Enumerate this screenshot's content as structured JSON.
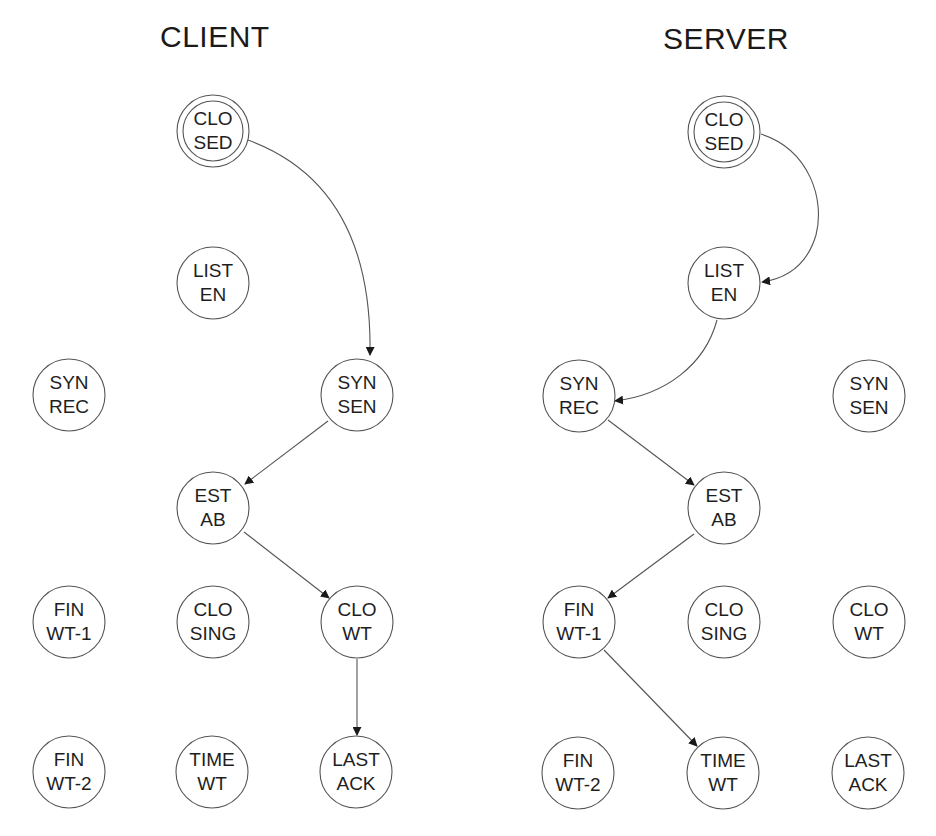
{
  "titles": {
    "client": "CLIENT",
    "server": "SERVER"
  },
  "colors": {
    "stroke": "#555555",
    "text": "#1e1e1e",
    "background": "#ffffff"
  },
  "client": {
    "nodes": [
      {
        "id": "closed",
        "line1": "CLO",
        "line2": "SED",
        "double": true,
        "x": 213,
        "y": 131
      },
      {
        "id": "listen",
        "line1": "LIST",
        "line2": "EN",
        "x": 213,
        "y": 283
      },
      {
        "id": "syn-rec",
        "line1": "SYN",
        "line2": "REC",
        "x": 69,
        "y": 395
      },
      {
        "id": "syn-sen",
        "line1": "SYN",
        "line2": "SEN",
        "x": 357,
        "y": 395
      },
      {
        "id": "estab",
        "line1": "EST",
        "line2": "AB",
        "x": 213,
        "y": 508
      },
      {
        "id": "fin-wt-1",
        "line1": "FIN",
        "line2": "WT-1",
        "x": 69,
        "y": 622
      },
      {
        "id": "closing",
        "line1": "CLO",
        "line2": "SING",
        "x": 213,
        "y": 622
      },
      {
        "id": "close-wt",
        "line1": "CLO",
        "line2": "WT",
        "x": 357,
        "y": 622
      },
      {
        "id": "fin-wt-2",
        "line1": "FIN",
        "line2": "WT-2",
        "x": 69,
        "y": 772
      },
      {
        "id": "time-wt",
        "line1": "TIME",
        "line2": "WT",
        "x": 213,
        "y": 772
      },
      {
        "id": "last-ack",
        "line1": "LAST",
        "line2": "ACK",
        "x": 357,
        "y": 772
      }
    ],
    "edges": [
      {
        "from": "closed",
        "to": "syn-sen",
        "curved": true
      },
      {
        "from": "syn-sen",
        "to": "estab"
      },
      {
        "from": "estab",
        "to": "close-wt"
      },
      {
        "from": "close-wt",
        "to": "last-ack"
      }
    ]
  },
  "server": {
    "nodes": [
      {
        "id": "closed",
        "line1": "CLO",
        "line2": "SED",
        "double": true,
        "x": 724,
        "y": 131
      },
      {
        "id": "listen",
        "line1": "LIST",
        "line2": "EN",
        "x": 724,
        "y": 283
      },
      {
        "id": "syn-rec",
        "line1": "SYN",
        "line2": "REC",
        "x": 579,
        "y": 396
      },
      {
        "id": "syn-sen",
        "line1": "SYN",
        "line2": "SEN",
        "x": 869,
        "y": 396
      },
      {
        "id": "estab",
        "line1": "EST",
        "line2": "AB",
        "x": 724,
        "y": 508
      },
      {
        "id": "fin-wt-1",
        "line1": "FIN",
        "line2": "WT-1",
        "x": 579,
        "y": 622
      },
      {
        "id": "closing",
        "line1": "CLO",
        "line2": "SING",
        "x": 724,
        "y": 622
      },
      {
        "id": "close-wt",
        "line1": "CLO",
        "line2": "WT",
        "x": 869,
        "y": 622
      },
      {
        "id": "fin-wt-2",
        "line1": "FIN",
        "line2": "WT-2",
        "x": 579,
        "y": 773
      },
      {
        "id": "time-wt",
        "line1": "TIME",
        "line2": "WT",
        "x": 724,
        "y": 773
      },
      {
        "id": "last-ack",
        "line1": "LAST",
        "line2": "ACK",
        "x": 869,
        "y": 773
      }
    ],
    "edges": [
      {
        "from": "closed",
        "to": "listen",
        "curved": true
      },
      {
        "from": "listen",
        "to": "syn-rec",
        "curved": true
      },
      {
        "from": "syn-rec",
        "to": "estab"
      },
      {
        "from": "estab",
        "to": "fin-wt-1"
      },
      {
        "from": "fin-wt-1",
        "to": "time-wt"
      }
    ]
  }
}
